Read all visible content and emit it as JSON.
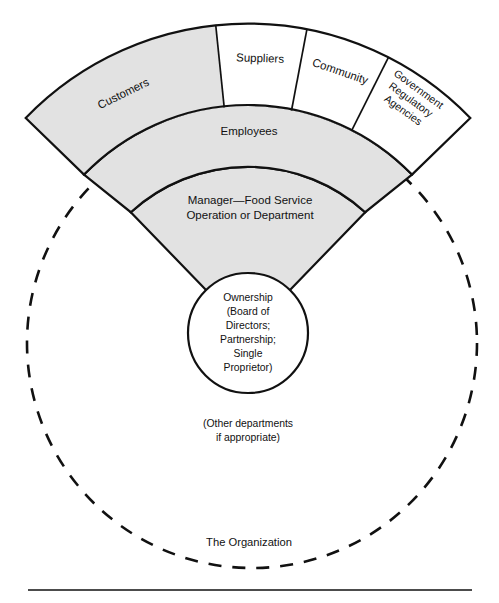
{
  "figure": {
    "title": "The Organization",
    "base_rule": true,
    "colors": {
      "shaded_fill": "#e2e2e2",
      "plain_fill": "#ffffff",
      "stroke": "#111111"
    },
    "outer_ring_segments": [
      {
        "label": "Customers",
        "fill": "shaded"
      },
      {
        "label": "Suppliers",
        "fill": "plain"
      },
      {
        "label": "Community",
        "fill": "plain"
      },
      {
        "label": "Government Regulatory Agencies",
        "lines": [
          "Government",
          "Regulatory",
          "Agencies"
        ],
        "fill": "plain"
      }
    ],
    "middle_ring": {
      "label": "Employees",
      "fill": "shaded"
    },
    "inner_ring": {
      "label": "Manager—Food Service Operation or Department",
      "lines": [
        "Manager—Food Service",
        "Operation or Department"
      ],
      "fill": "shaded"
    },
    "center_circle": {
      "lines": [
        "Ownership",
        "(Board of",
        "Directors;",
        "Partnership;",
        "Single",
        "Proprietor)"
      ]
    },
    "other_departments_note": {
      "lines": [
        "(Other departments",
        "if appropriate)"
      ]
    },
    "organization_boundary_label": "The Organization"
  }
}
